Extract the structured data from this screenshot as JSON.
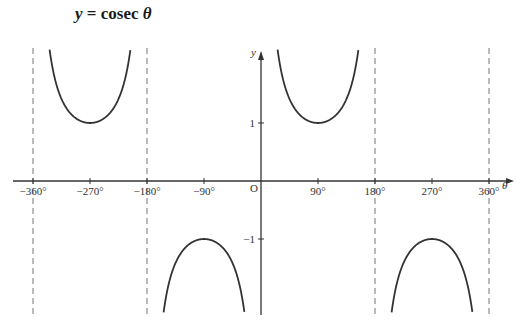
{
  "title": {
    "lhs": "y",
    "eq": " = ",
    "func": "cosec ",
    "var": "θ"
  },
  "chart_data": {
    "type": "line",
    "title": "y = cosec θ",
    "xlabel": "θ",
    "ylabel": "y",
    "origin_label": "O",
    "x_ticks": [
      -360,
      -270,
      -180,
      -90,
      90,
      180,
      270,
      360
    ],
    "x_tick_labels": [
      "−360°",
      "−270°",
      "−180°",
      "−90°",
      "90°",
      "180°",
      "270°",
      "360°"
    ],
    "y_ticks": [
      1,
      -1
    ],
    "y_tick_labels": [
      "1",
      "−1"
    ],
    "asymptotes": [
      -360,
      -180,
      180,
      360
    ],
    "xlim": [
      -380,
      380
    ],
    "ylim": [
      -2.3,
      2.3
    ],
    "series": [
      {
        "name": "cosec θ, -360°<θ<-180°",
        "x_range": [
          -360,
          -180
        ],
        "min_point": [
          -270,
          1
        ]
      },
      {
        "name": "cosec θ, -180°<θ<0°",
        "x_range": [
          -180,
          0
        ],
        "max_point": [
          -90,
          -1
        ]
      },
      {
        "name": "cosec θ, 0°<θ<180°",
        "x_range": [
          0,
          180
        ],
        "min_point": [
          90,
          1
        ]
      },
      {
        "name": "cosec θ, 180°<θ<360°",
        "x_range": [
          180,
          360
        ],
        "max_point": [
          270,
          -1
        ]
      }
    ],
    "grid": false,
    "legend": false,
    "colors": {
      "curve": "#333333",
      "axis": "#333333",
      "asymptote": "#777777"
    }
  }
}
